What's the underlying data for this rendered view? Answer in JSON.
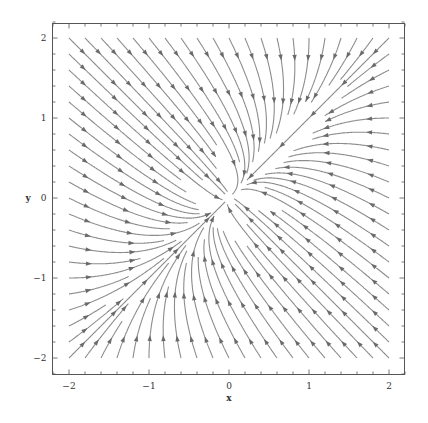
{
  "chart_data": {
    "type": "streamplot",
    "title": "",
    "xlabel": "x",
    "ylabel": "y",
    "xlim": [
      -2.2,
      2.2
    ],
    "ylim": [
      -2.2,
      2.2
    ],
    "x_major_ticks": [
      -2,
      -1,
      0,
      1,
      2
    ],
    "y_major_ticks": [
      -2,
      -1,
      0,
      1,
      2
    ],
    "x_tick_labels": [
      "−2",
      "−1",
      "0",
      "1",
      "2"
    ],
    "y_tick_labels": [
      "−2",
      "−1",
      "0",
      "1",
      "2"
    ],
    "minor_tick_step": 0.2,
    "grid": false,
    "legend": "none",
    "vector_field": {
      "dx_dt": "-2*x + y",
      "dy_dt": "x - 2*y",
      "coef": [
        [
          -2,
          1
        ],
        [
          1,
          -2
        ]
      ],
      "fixed_point": [
        0,
        0
      ],
      "fixed_point_type": "stable node",
      "slow_eigenvector": [
        1,
        1
      ],
      "fast_eigenvector": [
        1,
        -1
      ]
    },
    "seed_range": [
      -2,
      2
    ],
    "seed_step": 0.2,
    "colors": {
      "stream": "#8c8c8c",
      "arrow": "#6a6a6a",
      "frame": "#555555"
    }
  }
}
